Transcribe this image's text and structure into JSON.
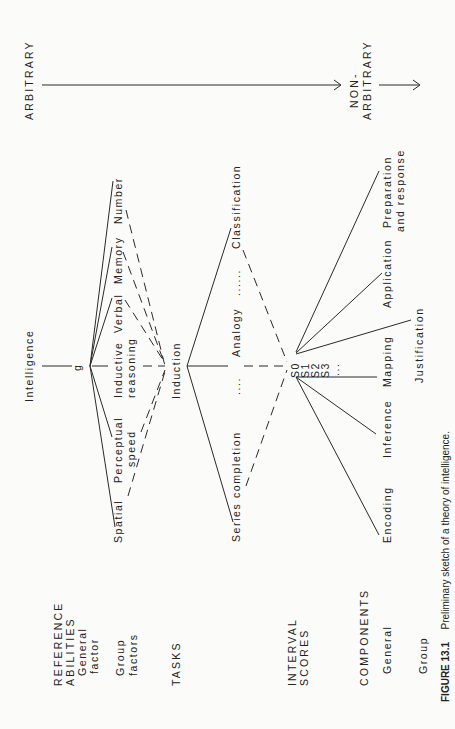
{
  "figure": {
    "caption_label": "FIGURE 13.1",
    "caption_text": "Preliminary sketch of a theory of intelligence."
  },
  "scale": {
    "arbitrary": "ARBITRARY",
    "non_arbitrary_1": "NON-",
    "non_arbitrary_2": "ARBITRARY"
  },
  "row_headers": {
    "reference_abilities_1": "REFERENCE",
    "reference_abilities_2": "ABILITIES",
    "general_factor_1": "General",
    "general_factor_2": "factor",
    "group_factors_1": "Group",
    "group_factors_2": "factors",
    "tasks": "TASKS",
    "interval_scores_1": "INTERVAL",
    "interval_scores_2": "SCORES",
    "components": "COMPONENTS",
    "components_general": "General",
    "components_group": "Group"
  },
  "nodes": {
    "intelligence": "Intelligence",
    "g": "g",
    "group_factors": {
      "number": "Number",
      "memory": "Memory",
      "verbal": "Verbal",
      "inductive_1": "Inductive",
      "inductive_2": "reasoning",
      "perceptual_1": "Perceptual",
      "perceptual_2": "speed",
      "spatial": "Spatial"
    },
    "induction": "Induction",
    "tasks": {
      "classification": "Classification",
      "dots_1": "......",
      "analogy": "Analogy",
      "dots_2": "....",
      "series": "Series completion"
    },
    "scores": {
      "s0": "S0",
      "s1": "S1",
      "s2": "S2",
      "s3": "S3",
      "ellipsis": "..."
    },
    "components": {
      "encoding": "Encoding",
      "inference": "Inference",
      "mapping": "Mapping",
      "justification": "Justification",
      "application": "Application",
      "preparation_1": "Preparation",
      "preparation_2": "and response"
    }
  }
}
